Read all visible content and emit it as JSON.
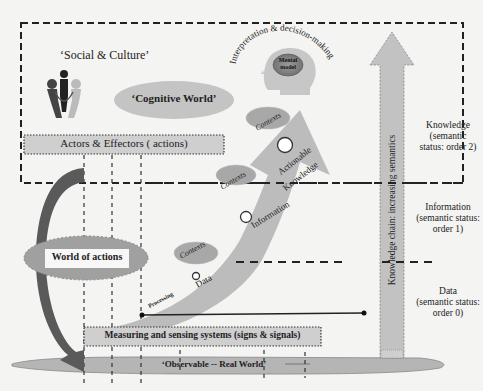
{
  "diagram": {
    "social_culture": "‘Social & Culture’",
    "cognitive_world": "‘Cognitive World’",
    "interpretation": "Interpretation & decision-making",
    "mental_model_line1": "Mental",
    "mental_model_line2": "model",
    "actors_effectors": "Actors & Effectors ( actions)",
    "world_of_actions": "World of actions",
    "measuring_systems": "Measuring and sensing systems (signs & signals)",
    "observable_world": "‘Observable -- Real World’",
    "knowledge_chain": "Knowledge chain: increasing semantics",
    "arrow_labels": {
      "processing": "Processing",
      "data": "Data",
      "information": "Information",
      "actionable": "Actionable",
      "knowledge": "Knowledge",
      "contexts": "Contexts"
    },
    "levels": [
      {
        "line1": "Knowledge",
        "line2": "(semantic",
        "line3": "status: order 2)"
      },
      {
        "line1": "Information",
        "line2": "(semantic status:",
        "line3": "order 1)"
      },
      {
        "line1": "Data",
        "line2": "(semantic status:",
        "line3": "order 0)"
      }
    ],
    "colors": {
      "fill_gray": "#bdbdbd",
      "dark_gray": "#6e6e6e",
      "arrow_dark": "#555555",
      "background": "#f4f4f2"
    }
  }
}
